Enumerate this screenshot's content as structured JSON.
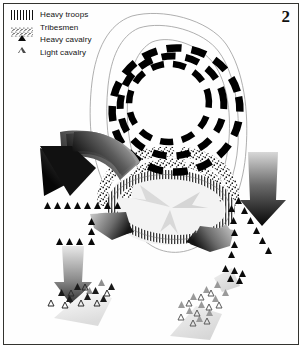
{
  "figure": {
    "plate_number": "2",
    "border_color": "#33332f",
    "background_color": "#ffffff"
  },
  "legend": {
    "items": [
      {
        "label": "Heavy troops",
        "icon": "vertical-hatch-swatch",
        "color": "#111111"
      },
      {
        "label": "Tribesmen",
        "icon": "stipple-dots-swatch",
        "color": "#111111"
      },
      {
        "label": "Heavy cavalry",
        "icon": "filled-triangle-icon",
        "color": "#0b0b0b"
      },
      {
        "label": "Light cavalry",
        "icon": "open-triangle-icon",
        "color": "#4a4a4a"
      }
    ]
  },
  "map": {
    "terrain": {
      "name": "hill-contours",
      "contour_count": 3,
      "stroke_color": "#9a9a9a"
    },
    "formations": [
      {
        "name": "heavy-troops-concentric-rings",
        "type": "dashed-ring",
        "unit": "Heavy troops",
        "ring_count": 3,
        "color": "#000000",
        "position": "upper-centre"
      },
      {
        "name": "heavy-troops-hatched-oval",
        "type": "hatched-oval",
        "unit": "Heavy troops",
        "color": "#3c3c3c",
        "position": "centre"
      },
      {
        "name": "tribesmen-stipple-arc",
        "type": "stipple-arc",
        "unit": "Tribesmen",
        "color": "#141414",
        "position": "centre-left-and-right"
      }
    ],
    "cavalry_lines": [
      {
        "name": "heavy-cavalry-line-left",
        "unit": "Heavy cavalry",
        "count": 8,
        "fill": "filled"
      },
      {
        "name": "heavy-cavalry-line-centre-left",
        "unit": "Heavy cavalry",
        "count": 3,
        "fill": "filled"
      },
      {
        "name": "heavy-cavalry-line-right",
        "unit": "Heavy cavalry",
        "count": 9,
        "fill": "filled"
      },
      {
        "name": "heavy-cavalry-line-lower-right",
        "unit": "Heavy cavalry",
        "count": 6,
        "fill": "filled"
      },
      {
        "name": "heavy-cavalry-line-lower-left",
        "unit": "Heavy cavalry",
        "count": 3,
        "fill": "filled"
      },
      {
        "name": "cavalry-cluster-bottom-left",
        "unit": "Heavy and light cavalry",
        "count": 15,
        "fill": "mixed"
      },
      {
        "name": "cavalry-cluster-bottom-right",
        "unit": "Heavy and light cavalry",
        "count": 19,
        "fill": "mixed"
      }
    ],
    "movement_arrows": [
      {
        "name": "arrow-curved-left",
        "direction": "down-left",
        "style": "curved-gradient"
      },
      {
        "name": "arrow-straight-right",
        "direction": "down",
        "style": "straight-gradient"
      },
      {
        "name": "arrow-small-centre-left",
        "direction": "right",
        "style": "curved-gradient"
      },
      {
        "name": "arrow-small-centre-right",
        "direction": "left",
        "style": "curved-gradient"
      },
      {
        "name": "arrow-bottom-left",
        "direction": "down",
        "style": "straight-gradient"
      },
      {
        "name": "arrow-inner-radial-a",
        "direction": "outward",
        "style": "pale-wedge"
      },
      {
        "name": "arrow-inner-radial-b",
        "direction": "outward",
        "style": "pale-wedge"
      },
      {
        "name": "arrow-inner-radial-c",
        "direction": "outward",
        "style": "pale-wedge"
      }
    ]
  }
}
